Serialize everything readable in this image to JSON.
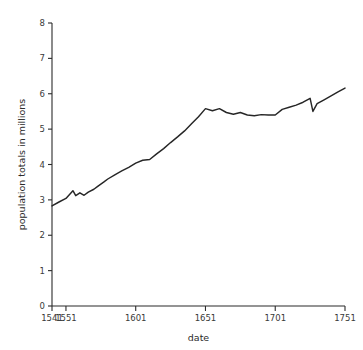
{
  "chart_data": {
    "type": "line",
    "title": "",
    "xlabel": "date",
    "ylabel": "population totals in millions",
    "xlim": [
      1541,
      1751
    ],
    "ylim": [
      0,
      8
    ],
    "grid": false,
    "legend": null,
    "xticks": [
      1541,
      1551,
      1601,
      1651,
      1701,
      1751
    ],
    "xtick_labels": [
      "1541",
      "1551",
      "1601",
      "1651",
      "1701",
      "1751"
    ],
    "yticks": [
      0,
      1,
      2,
      3,
      4,
      5,
      6,
      7,
      8
    ],
    "ytick_labels": [
      "0",
      "1",
      "2",
      "3",
      "4",
      "5",
      "6",
      "7",
      "8"
    ],
    "series": [
      {
        "name": "population totals in millions",
        "color": "#262626",
        "x": [
          1541,
          1546,
          1551,
          1556,
          1558,
          1561,
          1564,
          1567,
          1571,
          1574,
          1578,
          1581,
          1586,
          1591,
          1596,
          1601,
          1606,
          1611,
          1616,
          1621,
          1626,
          1631,
          1636,
          1641,
          1646,
          1651,
          1656,
          1661,
          1666,
          1671,
          1676,
          1681,
          1686,
          1691,
          1696,
          1701,
          1706,
          1711,
          1716,
          1721,
          1726,
          1728,
          1731,
          1736,
          1741,
          1746,
          1751
        ],
        "y": [
          2.83,
          2.94,
          3.04,
          3.26,
          3.12,
          3.2,
          3.13,
          3.22,
          3.3,
          3.39,
          3.5,
          3.59,
          3.71,
          3.82,
          3.92,
          4.04,
          4.12,
          4.14,
          4.3,
          4.45,
          4.62,
          4.78,
          4.95,
          5.15,
          5.35,
          5.58,
          5.52,
          5.58,
          5.47,
          5.42,
          5.47,
          5.4,
          5.38,
          5.41,
          5.4,
          5.4,
          5.56,
          5.62,
          5.68,
          5.76,
          5.87,
          5.5,
          5.72,
          5.83,
          5.94,
          6.05,
          6.16
        ]
      }
    ]
  },
  "axes": {
    "x_axis_label": "date",
    "y_axis_label": "population totals in millions"
  }
}
